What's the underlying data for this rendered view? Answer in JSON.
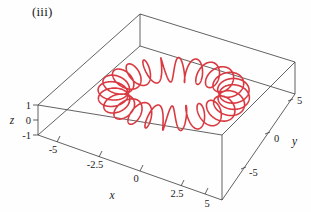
{
  "figure": {
    "panel_label": "(iii)",
    "curve_color": "#d93a42",
    "axis_color": "#3a3a3a",
    "background_color": "#fefefe"
  },
  "axes": {
    "x": {
      "title": "x",
      "ticks": [
        "-5",
        "-2.5",
        "0",
        "2.5",
        "5"
      ],
      "range": [
        -6.5,
        6.5
      ]
    },
    "y": {
      "title": "y",
      "ticks": [
        "5",
        "0",
        "-5"
      ],
      "range": [
        -6.5,
        6.5
      ]
    },
    "z": {
      "title": "z",
      "ticks": [
        "1",
        "0",
        "-1"
      ],
      "range": [
        -1.4,
        1.4
      ]
    }
  },
  "chart_data": {
    "type": "line",
    "title": "(iii)",
    "xlabel": "x",
    "ylabel": "y",
    "zlabel": "z",
    "projection": "3d",
    "grid": false,
    "legend": null,
    "xlim": [
      -6.5,
      6.5
    ],
    "ylim": [
      -6.5,
      6.5
    ],
    "zlim": [
      -1.4,
      1.4
    ],
    "xticks": [
      -5,
      -2.5,
      0,
      2.5,
      5
    ],
    "yticks": [
      5,
      0,
      -5
    ],
    "zticks": [
      1,
      0,
      -1
    ],
    "series": [
      {
        "name": "toroidal-coil",
        "color": "#d93a42",
        "parametric": {
          "t_range": [
            0,
            6.283185307179586
          ],
          "turns": 24,
          "major_radius": 4.0,
          "minor_radius": 1.0,
          "x_expr": "(4 + cos(24 t)) cos(t)",
          "y_expr": "(4 + cos(24 t)) sin(t)",
          "z_expr": "sin(24 t)"
        }
      }
    ]
  }
}
